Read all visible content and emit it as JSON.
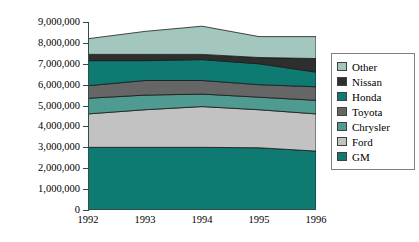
{
  "chart_data": {
    "type": "area",
    "title": "",
    "subtitle": "",
    "xlabel": "",
    "ylabel": "",
    "stacked": true,
    "grid": false,
    "legend_position": "right",
    "categories": [
      "1992",
      "1993",
      "1994",
      "1995",
      "1996"
    ],
    "x": [
      1992,
      1993,
      1994,
      1995,
      1996
    ],
    "xlim": [
      1992,
      1996
    ],
    "ylim": [
      0,
      9000000
    ],
    "y_ticks": [
      0,
      1000000,
      2000000,
      3000000,
      4000000,
      5000000,
      6000000,
      7000000,
      8000000,
      9000000
    ],
    "y_tick_labels": [
      "9,000,000",
      "8,000,000",
      "7,000,000",
      "6,000,000",
      "5,000,000",
      "4,000,000",
      "3,000,000",
      "2,000,000",
      "1,000,000",
      "0"
    ],
    "x_tick_labels": [
      "1992",
      "1993",
      "1994",
      "1995",
      "1996"
    ],
    "series": [
      {
        "name": "GM",
        "color": "#0f7a72",
        "values": [
          3000000,
          3000000,
          3000000,
          2980000,
          2820000
        ],
        "cumulative_top": [
          3000000,
          3000000,
          3000000,
          2980000,
          2820000
        ]
      },
      {
        "name": "Ford",
        "color": "#c2c2c2",
        "values": [
          1600000,
          1800000,
          1950000,
          1820000,
          1780000
        ],
        "cumulative_top": [
          4600000,
          4800000,
          4950000,
          4800000,
          4600000
        ]
      },
      {
        "name": "Chrysler",
        "color": "#4f9b92",
        "values": [
          750000,
          700000,
          600000,
          600000,
          650000
        ],
        "cumulative_top": [
          5350000,
          5500000,
          5550000,
          5400000,
          5250000
        ]
      },
      {
        "name": "Toyota",
        "color": "#666666",
        "values": [
          600000,
          700000,
          650000,
          600000,
          650000
        ],
        "cumulative_top": [
          5950000,
          6200000,
          6200000,
          6000000,
          5900000
        ]
      },
      {
        "name": "Honda",
        "color": "#0f7a72",
        "values": [
          1200000,
          950000,
          1000000,
          1000000,
          700000
        ],
        "cumulative_top": [
          7150000,
          7150000,
          7200000,
          7000000,
          6600000
        ]
      },
      {
        "name": "Nissan",
        "color": "#2e2e2e",
        "values": [
          300000,
          300000,
          250000,
          300000,
          650000
        ],
        "cumulative_top": [
          7450000,
          7450000,
          7450000,
          7300000,
          7250000
        ]
      },
      {
        "name": "Other",
        "color": "#a3c6bf",
        "values": [
          750000,
          1100000,
          1350000,
          1000000,
          1050000
        ],
        "cumulative_top": [
          8200000,
          8550000,
          8800000,
          8300000,
          8300000
        ]
      }
    ],
    "totals": [
      8200000,
      8550000,
      8800000,
      8300000,
      8300000
    ]
  },
  "legend": {
    "items": [
      {
        "label": "Other",
        "color": "#a3c6bf"
      },
      {
        "label": "Nissan",
        "color": "#2e2e2e"
      },
      {
        "label": "Honda",
        "color": "#0f7a72"
      },
      {
        "label": "Toyota",
        "color": "#666666"
      },
      {
        "label": "Chrysler",
        "color": "#4f9b92"
      },
      {
        "label": "Ford",
        "color": "#c2c2c2"
      },
      {
        "label": "GM",
        "color": "#0f7a72"
      }
    ]
  },
  "colors": {
    "axis": "#2d4f4a",
    "legend_border": "#808080",
    "series_outline": "#1a1a1a",
    "background": "#ffffff"
  }
}
